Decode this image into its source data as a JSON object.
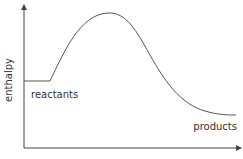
{
  "diagram": {
    "type": "energy-profile",
    "y_axis_label": "enthalpy",
    "x_axis_label": "",
    "labels": {
      "reactants": "reactants",
      "products": "products"
    },
    "colors": {
      "axis": "#444444",
      "curve": "#555555",
      "text": "#333333"
    }
  }
}
